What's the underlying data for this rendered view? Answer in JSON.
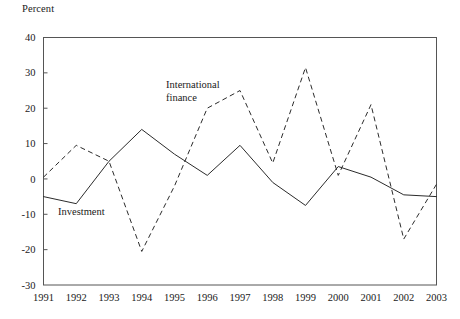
{
  "chart_data": {
    "type": "line",
    "title": "",
    "xlabel": "",
    "ylabel": "Percent",
    "categories": [
      1991,
      1992,
      1993,
      1994,
      1995,
      1996,
      1997,
      1998,
      1999,
      2000,
      2001,
      2002,
      2003
    ],
    "xtick_labels": [
      "1991",
      "1992",
      "1993",
      "1994",
      "1995",
      "1996",
      "1997",
      "1998",
      "1999",
      "2000",
      "2001",
      "2002",
      "2003"
    ],
    "ytick_labels": [
      "40",
      "30",
      "20",
      "10",
      "0",
      "-10",
      "-20",
      "-30"
    ],
    "yticks": [
      40,
      30,
      20,
      10,
      0,
      -10,
      -20,
      -30
    ],
    "ylim": [
      -30,
      40
    ],
    "xlim": [
      1991,
      2003
    ],
    "grid": false,
    "legend_position": "inline-annotations",
    "series": [
      {
        "name": "Investment",
        "style": "solid",
        "color": "#2b2b2b",
        "values": [
          -5,
          -7,
          5,
          14,
          7,
          1,
          9.5,
          -1,
          -7.5,
          3.5,
          0.5,
          -4.5,
          -5
        ]
      },
      {
        "name": "International finance",
        "style": "dashed",
        "color": "#2b2b2b",
        "values": [
          0.5,
          9.5,
          5,
          -20.5,
          -2,
          20,
          25,
          4.5,
          31.5,
          1,
          21,
          -17,
          -1.5
        ]
      }
    ],
    "annotations": [
      {
        "id": "international-finance",
        "lines": [
          "International",
          "finance"
        ],
        "x_px": 166,
        "y_px": 88
      },
      {
        "id": "investment",
        "lines": [
          "Investment"
        ],
        "x_px": 58,
        "y_px": 215
      }
    ]
  }
}
